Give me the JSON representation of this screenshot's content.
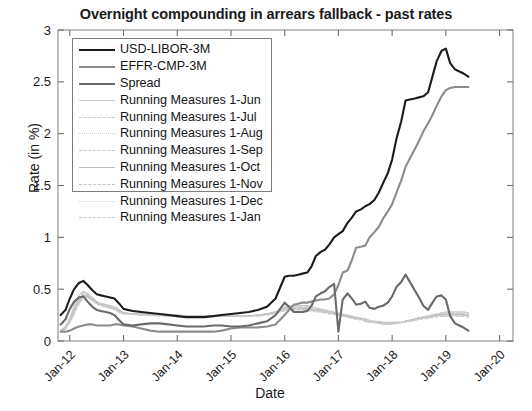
{
  "figure": {
    "width": 532,
    "height": 411,
    "background": "#ffffff"
  },
  "chart_data": {
    "type": "line",
    "title": "Overnight compounding in arrears fallback - past rates",
    "xlabel": "Date",
    "ylabel": "Rate (in %)",
    "grid": false,
    "legend_position": "upper-left",
    "ylim": [
      0,
      3
    ],
    "yticks": [
      "0",
      "0.5",
      "1",
      "1.5",
      "2",
      "2.5",
      "3"
    ],
    "ytick_values": [
      0,
      0.5,
      1,
      1.5,
      2,
      2.5,
      3
    ],
    "xlim": [
      "Jan-12",
      "Jan-20"
    ],
    "xticks": [
      "Jan-12",
      "Jan-13",
      "Jan-14",
      "Jan-15",
      "Jan-16",
      "Jan-17",
      "Jan-18",
      "Jan-19",
      "Jan-20"
    ],
    "xtick_values": [
      2012.0,
      2013.0,
      2014.0,
      2015.0,
      2016.0,
      2017.0,
      2018.0,
      2019.0,
      2020.0
    ],
    "xtick_rotation": -45,
    "x": [
      2011.83,
      2011.92,
      2012.0,
      2012.08,
      2012.17,
      2012.25,
      2012.33,
      2012.42,
      2012.5,
      2012.58,
      2012.67,
      2012.75,
      2012.83,
      2012.92,
      2013.0,
      2013.17,
      2013.33,
      2013.5,
      2013.67,
      2013.83,
      2014.0,
      2014.17,
      2014.33,
      2014.5,
      2014.67,
      2014.83,
      2015.0,
      2015.17,
      2015.33,
      2015.5,
      2015.67,
      2015.83,
      2016.0,
      2016.08,
      2016.17,
      2016.25,
      2016.33,
      2016.42,
      2016.5,
      2016.58,
      2016.67,
      2016.75,
      2016.83,
      2016.92,
      2017.0,
      2017.08,
      2017.17,
      2017.25,
      2017.33,
      2017.42,
      2017.5,
      2017.58,
      2017.67,
      2017.75,
      2017.83,
      2017.92,
      2018.0,
      2018.08,
      2018.17,
      2018.25,
      2018.33,
      2018.42,
      2018.5,
      2018.58,
      2018.67,
      2018.75,
      2018.83,
      2018.92,
      2019.0,
      2019.08,
      2019.17,
      2019.25,
      2019.33,
      2019.42
    ],
    "series": [
      {
        "name": "USD-LIBOR-3M",
        "color": "#1c1c1c",
        "linestyle": "solid",
        "linewidth": 2.1,
        "values": [
          0.25,
          0.3,
          0.41,
          0.5,
          0.56,
          0.58,
          0.54,
          0.49,
          0.45,
          0.44,
          0.43,
          0.42,
          0.41,
          0.36,
          0.31,
          0.29,
          0.28,
          0.27,
          0.26,
          0.25,
          0.24,
          0.23,
          0.23,
          0.23,
          0.24,
          0.25,
          0.26,
          0.27,
          0.28,
          0.3,
          0.33,
          0.41,
          0.62,
          0.63,
          0.63,
          0.64,
          0.65,
          0.66,
          0.72,
          0.82,
          0.86,
          0.88,
          0.93,
          1.0,
          1.03,
          1.06,
          1.14,
          1.19,
          1.25,
          1.27,
          1.3,
          1.32,
          1.36,
          1.43,
          1.52,
          1.62,
          1.75,
          1.95,
          2.12,
          2.32,
          2.33,
          2.34,
          2.35,
          2.36,
          2.4,
          2.55,
          2.7,
          2.8,
          2.82,
          2.68,
          2.62,
          2.6,
          2.58,
          2.55
        ]
      },
      {
        "name": "EFFR-CMP-3M",
        "color": "#8c8c8c",
        "linestyle": "solid",
        "linewidth": 2.1,
        "values": [
          0.09,
          0.09,
          0.1,
          0.12,
          0.14,
          0.15,
          0.16,
          0.16,
          0.15,
          0.15,
          0.15,
          0.15,
          0.16,
          0.16,
          0.15,
          0.14,
          0.12,
          0.1,
          0.09,
          0.09,
          0.09,
          0.09,
          0.09,
          0.09,
          0.09,
          0.1,
          0.12,
          0.13,
          0.13,
          0.13,
          0.14,
          0.16,
          0.25,
          0.3,
          0.35,
          0.36,
          0.37,
          0.37,
          0.38,
          0.39,
          0.4,
          0.4,
          0.41,
          0.45,
          0.54,
          0.66,
          0.68,
          0.78,
          0.9,
          0.91,
          0.92,
          1.0,
          1.05,
          1.1,
          1.18,
          1.25,
          1.32,
          1.43,
          1.55,
          1.68,
          1.76,
          1.85,
          1.93,
          2.02,
          2.1,
          2.18,
          2.27,
          2.36,
          2.42,
          2.44,
          2.45,
          2.45,
          2.45,
          2.45
        ]
      },
      {
        "name": "Spread",
        "color": "#6a6a6a",
        "linestyle": "solid",
        "linewidth": 2.1,
        "values": [
          0.16,
          0.21,
          0.31,
          0.38,
          0.42,
          0.43,
          0.38,
          0.33,
          0.3,
          0.29,
          0.28,
          0.27,
          0.25,
          0.2,
          0.16,
          0.15,
          0.16,
          0.17,
          0.17,
          0.16,
          0.15,
          0.14,
          0.14,
          0.14,
          0.15,
          0.15,
          0.14,
          0.14,
          0.15,
          0.17,
          0.19,
          0.25,
          0.37,
          0.33,
          0.28,
          0.28,
          0.28,
          0.29,
          0.34,
          0.43,
          0.46,
          0.48,
          0.52,
          0.55,
          0.09,
          0.4,
          0.46,
          0.41,
          0.35,
          0.36,
          0.38,
          0.32,
          0.31,
          0.33,
          0.34,
          0.37,
          0.43,
          0.52,
          0.57,
          0.64,
          0.57,
          0.49,
          0.42,
          0.34,
          0.3,
          0.37,
          0.43,
          0.44,
          0.4,
          0.24,
          0.17,
          0.15,
          0.13,
          0.1
        ]
      },
      {
        "name": "Running Measures 1-Jun",
        "color": "#c9c9c9",
        "linestyle": "solid",
        "linewidth": 1.3,
        "values": [
          0.1,
          0.14,
          0.22,
          0.34,
          0.44,
          0.48,
          0.46,
          0.42,
          0.38,
          0.36,
          0.35,
          0.34,
          0.33,
          0.3,
          0.27,
          0.26,
          0.26,
          0.26,
          0.26,
          0.26,
          0.25,
          0.24,
          0.24,
          0.24,
          0.24,
          0.24,
          0.24,
          0.24,
          0.24,
          0.25,
          0.26,
          0.28,
          0.33,
          0.34,
          0.34,
          0.34,
          0.34,
          0.34,
          0.33,
          0.32,
          0.31,
          0.3,
          0.29,
          0.28,
          0.27,
          0.26,
          0.25,
          0.24,
          0.23,
          0.22,
          0.21,
          0.2,
          0.19,
          0.19,
          0.18,
          0.18,
          0.18,
          0.18,
          0.18,
          0.19,
          0.2,
          0.21,
          0.22,
          0.23,
          0.24,
          0.25,
          0.26,
          0.27,
          0.28,
          0.28,
          0.28,
          0.28,
          0.28,
          0.27
        ]
      },
      {
        "name": "Running Measures 1-Jul",
        "color": "#cccccc",
        "linestyle": "dashed",
        "linewidth": 1.3,
        "values": [
          0.1,
          0.13,
          0.21,
          0.32,
          0.42,
          0.47,
          0.45,
          0.41,
          0.38,
          0.36,
          0.35,
          0.34,
          0.33,
          0.3,
          0.27,
          0.26,
          0.26,
          0.26,
          0.26,
          0.25,
          0.25,
          0.24,
          0.24,
          0.24,
          0.24,
          0.24,
          0.24,
          0.24,
          0.24,
          0.25,
          0.26,
          0.28,
          0.32,
          0.33,
          0.33,
          0.33,
          0.33,
          0.33,
          0.32,
          0.31,
          0.3,
          0.29,
          0.28,
          0.27,
          0.26,
          0.25,
          0.24,
          0.23,
          0.22,
          0.21,
          0.21,
          0.2,
          0.19,
          0.18,
          0.18,
          0.18,
          0.18,
          0.18,
          0.18,
          0.19,
          0.2,
          0.21,
          0.22,
          0.23,
          0.24,
          0.25,
          0.26,
          0.27,
          0.27,
          0.27,
          0.27,
          0.27,
          0.27,
          0.26
        ]
      },
      {
        "name": "Running Measures 1-Aug",
        "color": "#d0d0d0",
        "linestyle": "dotted",
        "linewidth": 1.3,
        "values": [
          0.1,
          0.13,
          0.2,
          0.31,
          0.41,
          0.46,
          0.45,
          0.41,
          0.37,
          0.36,
          0.35,
          0.34,
          0.32,
          0.29,
          0.27,
          0.26,
          0.26,
          0.26,
          0.25,
          0.25,
          0.25,
          0.24,
          0.24,
          0.24,
          0.24,
          0.24,
          0.24,
          0.24,
          0.24,
          0.25,
          0.26,
          0.28,
          0.32,
          0.33,
          0.33,
          0.33,
          0.33,
          0.32,
          0.31,
          0.3,
          0.3,
          0.29,
          0.28,
          0.27,
          0.26,
          0.25,
          0.24,
          0.23,
          0.22,
          0.21,
          0.2,
          0.19,
          0.19,
          0.18,
          0.18,
          0.17,
          0.17,
          0.18,
          0.18,
          0.19,
          0.2,
          0.21,
          0.22,
          0.23,
          0.24,
          0.25,
          0.26,
          0.26,
          0.27,
          0.27,
          0.27,
          0.27,
          0.26,
          0.26
        ]
      },
      {
        "name": "Running Measures 1-Sep",
        "color": "#c6c6c6",
        "linestyle": "dashdot",
        "linewidth": 1.3,
        "values": [
          0.1,
          0.13,
          0.2,
          0.3,
          0.4,
          0.45,
          0.44,
          0.4,
          0.37,
          0.35,
          0.34,
          0.33,
          0.32,
          0.29,
          0.27,
          0.26,
          0.26,
          0.25,
          0.25,
          0.25,
          0.25,
          0.24,
          0.24,
          0.24,
          0.24,
          0.24,
          0.24,
          0.24,
          0.24,
          0.25,
          0.26,
          0.28,
          0.31,
          0.32,
          0.32,
          0.32,
          0.32,
          0.32,
          0.31,
          0.3,
          0.29,
          0.29,
          0.28,
          0.27,
          0.26,
          0.25,
          0.24,
          0.23,
          0.22,
          0.21,
          0.2,
          0.19,
          0.18,
          0.18,
          0.17,
          0.17,
          0.17,
          0.18,
          0.18,
          0.19,
          0.2,
          0.21,
          0.22,
          0.23,
          0.24,
          0.25,
          0.25,
          0.26,
          0.26,
          0.26,
          0.26,
          0.26,
          0.26,
          0.25
        ]
      },
      {
        "name": "Running Measures 1-Oct",
        "color": "#bdbdbd",
        "linestyle": "solid",
        "linewidth": 1.3,
        "values": [
          0.1,
          0.13,
          0.19,
          0.29,
          0.39,
          0.44,
          0.43,
          0.4,
          0.37,
          0.35,
          0.34,
          0.33,
          0.31,
          0.29,
          0.27,
          0.26,
          0.26,
          0.25,
          0.25,
          0.25,
          0.24,
          0.24,
          0.24,
          0.24,
          0.24,
          0.24,
          0.24,
          0.24,
          0.24,
          0.25,
          0.26,
          0.27,
          0.31,
          0.31,
          0.31,
          0.31,
          0.31,
          0.31,
          0.3,
          0.3,
          0.29,
          0.28,
          0.27,
          0.27,
          0.26,
          0.25,
          0.24,
          0.23,
          0.22,
          0.21,
          0.2,
          0.19,
          0.18,
          0.18,
          0.17,
          0.17,
          0.17,
          0.17,
          0.18,
          0.19,
          0.2,
          0.21,
          0.22,
          0.23,
          0.23,
          0.24,
          0.25,
          0.25,
          0.26,
          0.26,
          0.26,
          0.26,
          0.25,
          0.25
        ]
      },
      {
        "name": "Running Measures 1-Nov",
        "color": "#c2c2c2",
        "linestyle": "dashed",
        "linewidth": 1.3,
        "values": [
          0.1,
          0.12,
          0.19,
          0.28,
          0.38,
          0.43,
          0.43,
          0.4,
          0.36,
          0.35,
          0.34,
          0.32,
          0.31,
          0.28,
          0.27,
          0.26,
          0.25,
          0.25,
          0.25,
          0.25,
          0.24,
          0.24,
          0.24,
          0.24,
          0.24,
          0.24,
          0.24,
          0.24,
          0.24,
          0.25,
          0.26,
          0.27,
          0.3,
          0.31,
          0.31,
          0.31,
          0.31,
          0.3,
          0.3,
          0.29,
          0.29,
          0.28,
          0.27,
          0.26,
          0.25,
          0.25,
          0.24,
          0.23,
          0.22,
          0.21,
          0.2,
          0.19,
          0.18,
          0.17,
          0.17,
          0.17,
          0.17,
          0.17,
          0.18,
          0.19,
          0.2,
          0.21,
          0.21,
          0.22,
          0.23,
          0.24,
          0.24,
          0.25,
          0.25,
          0.25,
          0.25,
          0.25,
          0.25,
          0.24
        ]
      },
      {
        "name": "Running Measures 1-Dec",
        "color": "#d4d4d4",
        "linestyle": "dotted",
        "linewidth": 1.3,
        "values": [
          0.1,
          0.12,
          0.18,
          0.27,
          0.37,
          0.43,
          0.42,
          0.39,
          0.36,
          0.34,
          0.33,
          0.32,
          0.31,
          0.28,
          0.26,
          0.26,
          0.25,
          0.25,
          0.25,
          0.24,
          0.24,
          0.24,
          0.24,
          0.24,
          0.24,
          0.24,
          0.24,
          0.24,
          0.24,
          0.25,
          0.25,
          0.27,
          0.3,
          0.3,
          0.3,
          0.3,
          0.3,
          0.3,
          0.29,
          0.29,
          0.28,
          0.28,
          0.27,
          0.26,
          0.25,
          0.24,
          0.23,
          0.22,
          0.21,
          0.21,
          0.2,
          0.19,
          0.18,
          0.17,
          0.17,
          0.16,
          0.16,
          0.17,
          0.18,
          0.19,
          0.19,
          0.2,
          0.21,
          0.22,
          0.23,
          0.23,
          0.24,
          0.24,
          0.25,
          0.25,
          0.25,
          0.25,
          0.24,
          0.24
        ]
      },
      {
        "name": "Running Measures 1-Jan",
        "color": "#c9c9c9",
        "linestyle": "dashdot",
        "linewidth": 1.3,
        "values": [
          0.1,
          0.12,
          0.18,
          0.26,
          0.36,
          0.42,
          0.42,
          0.39,
          0.36,
          0.34,
          0.33,
          0.32,
          0.3,
          0.28,
          0.26,
          0.26,
          0.25,
          0.25,
          0.24,
          0.24,
          0.24,
          0.24,
          0.24,
          0.24,
          0.24,
          0.24,
          0.24,
          0.24,
          0.24,
          0.24,
          0.25,
          0.27,
          0.29,
          0.3,
          0.3,
          0.3,
          0.3,
          0.29,
          0.29,
          0.28,
          0.28,
          0.27,
          0.26,
          0.26,
          0.25,
          0.24,
          0.23,
          0.22,
          0.21,
          0.2,
          0.19,
          0.18,
          0.18,
          0.17,
          0.16,
          0.16,
          0.16,
          0.17,
          0.18,
          0.18,
          0.19,
          0.2,
          0.21,
          0.21,
          0.22,
          0.23,
          0.23,
          0.24,
          0.24,
          0.24,
          0.24,
          0.24,
          0.24,
          0.23
        ]
      }
    ]
  }
}
